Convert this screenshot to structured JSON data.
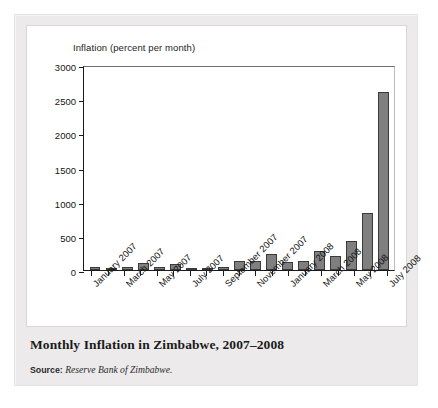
{
  "figure": {
    "title": "Monthly Inflation in Zimbabwe, 2007–2008",
    "source_label": "Source:",
    "source_text": "Reserve Bank of Zimbabwe.",
    "background_color": "#eceaea",
    "panel_color": "#ffffff"
  },
  "chart_data": {
    "type": "bar",
    "title": "Monthly Inflation in Zimbabwe, 2007–2008",
    "xlabel": "",
    "ylabel": "Inflation (percent per month)",
    "axis_title": "Inflation (percent per month)",
    "ylim": [
      0,
      3000
    ],
    "yticks": [
      0,
      500,
      1000,
      1500,
      2000,
      2500,
      3000
    ],
    "ytick_labels": [
      "0",
      "500",
      "1000",
      "1500",
      "2000",
      "2500",
      "3000"
    ],
    "grid": false,
    "legend": false,
    "bar_color": "#7f7f7f",
    "bar_edge_color": "#3a3a3a",
    "categories": [
      "January 2007",
      "February 2007",
      "March 2007",
      "April 2007",
      "May 2007",
      "June 2007",
      "July 2007",
      "August 2007",
      "September 2007",
      "October 2007",
      "November 2007",
      "December 2007",
      "January 2008",
      "February 2008",
      "March 2008",
      "April 2008",
      "May 2008",
      "June 2008",
      "July 2008"
    ],
    "values": [
      45,
      30,
      50,
      100,
      45,
      85,
      30,
      12,
      40,
      135,
      135,
      240,
      120,
      135,
      280,
      205,
      430,
      840,
      2600
    ],
    "visible_xtick_labels": [
      "January 2007",
      "March 2007",
      "May 2007",
      "July 2007",
      "September 2007",
      "November 2007",
      "January 2008",
      "March 2008",
      "May 2008",
      "July 2008"
    ],
    "xtick_label_indices": [
      0,
      2,
      4,
      6,
      8,
      10,
      12,
      14,
      16,
      18
    ],
    "xtick_label_rotation": -45
  }
}
